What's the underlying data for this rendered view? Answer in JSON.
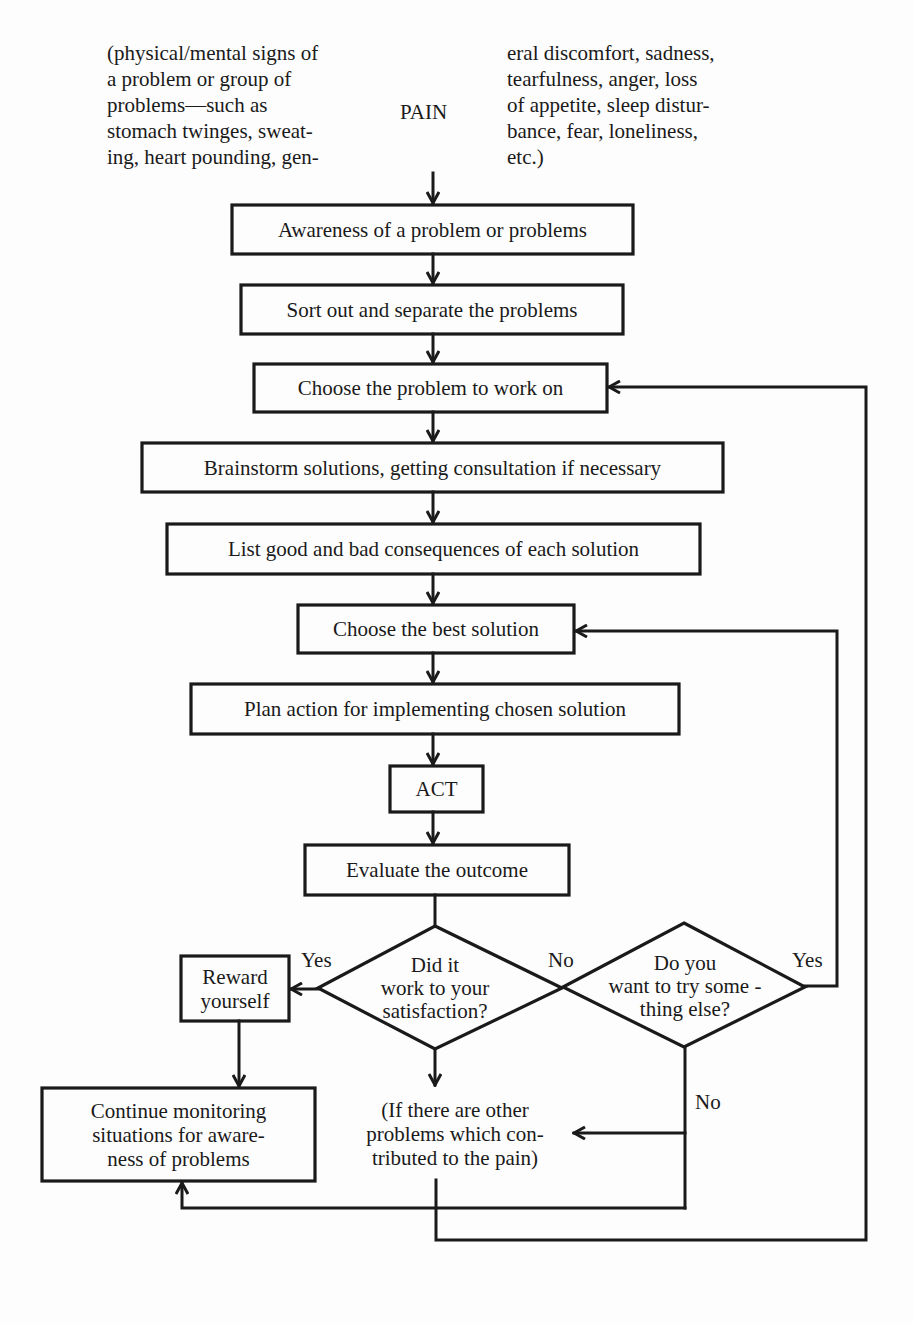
{
  "header": {
    "center_label": "PAIN",
    "left_text": "(physical/mental signs of\na problem or group of\nproblems—such as\nstomach twinges, sweat-\ning, heart pounding, gen-",
    "right_text": "eral discomfort, sadness,\ntearfulness, anger, loss\nof appetite, sleep distur-\nbance, fear, loneliness,\netc.)"
  },
  "steps": [
    {
      "id": "awareness",
      "label": "Awareness of a problem or problems"
    },
    {
      "id": "sort",
      "label": "Sort out and separate the problems"
    },
    {
      "id": "choose_problem",
      "label": "Choose the problem to work on"
    },
    {
      "id": "brainstorm",
      "label": "Brainstorm solutions, getting consultation if necessary"
    },
    {
      "id": "list_consequences",
      "label": "List good and bad consequences of each solution"
    },
    {
      "id": "choose_solution",
      "label": "Choose the best solution"
    },
    {
      "id": "plan_action",
      "label": "Plan action for implementing chosen solution"
    },
    {
      "id": "act",
      "label": "ACT"
    },
    {
      "id": "evaluate",
      "label": "Evaluate the outcome"
    }
  ],
  "decisions": [
    {
      "id": "did_it_work",
      "label": "Did it\nwork  to your\nsatisfaction?",
      "yes_label": "Yes",
      "no_label": "No"
    },
    {
      "id": "try_else",
      "label": "Do you\nwant  to try some -\nthing else?",
      "yes_label": "Yes",
      "no_label": "No"
    }
  ],
  "outcomes": {
    "reward": "Reward\nyourself",
    "continue_monitoring": "Continue monitoring\nsituations for aware-\nness of problems",
    "other_problems": "(If there are other\nproblems which con-\ntributed to the pain)"
  },
  "colors": {
    "ink": "#1a1a1a",
    "background": "#fdfdfd"
  }
}
